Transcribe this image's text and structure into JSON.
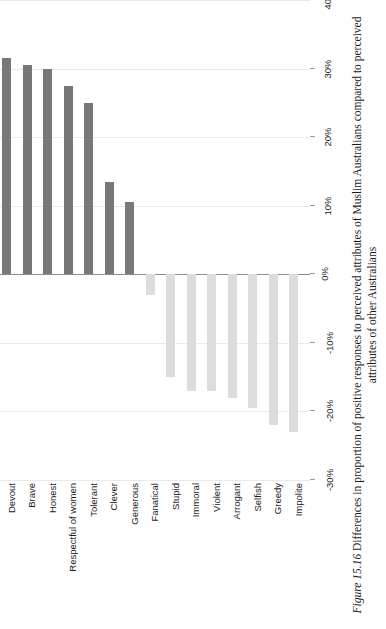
{
  "caption": {
    "label": "Figure 15.16",
    "text": "Differences in proportion of positive responses to perceived attributes of Muslim Australians compared to perceived attributes of other Australians"
  },
  "colors": {
    "positive_bar": "#787878",
    "negative_bar": "#dcdcdc",
    "gridline": "#e9e9e9",
    "zero_line": "#8c8c8c",
    "background": "#ffffff"
  },
  "chart_data": {
    "type": "bar",
    "title": "",
    "subtitle": "",
    "xlabel": "",
    "ylabel": "",
    "orientation": "vertical",
    "grid": true,
    "legend": false,
    "legend_position": "none",
    "ylim": [
      -30,
      40
    ],
    "ytick_labels": [
      "40%",
      "30%",
      "20%",
      "10%",
      "0%",
      "-10%",
      "-20%",
      "-30%"
    ],
    "ytick_values": [
      40,
      30,
      20,
      10,
      0,
      -10,
      -20,
      -30
    ],
    "categories": [
      "Devout",
      "Brave",
      "Honest",
      "Respectful of women",
      "Tolerant",
      "Clever",
      "Generous",
      "Fanatical",
      "Stupid",
      "Immoral",
      "Violent",
      "Arrogant",
      "Selfish",
      "Greedy",
      "Impolite"
    ],
    "values": [
      31.5,
      30.5,
      30,
      27.5,
      25,
      13.5,
      10.5,
      -3,
      -15,
      -17,
      -17,
      -18,
      -19.5,
      -22,
      -23
    ],
    "value_unit": "%"
  }
}
